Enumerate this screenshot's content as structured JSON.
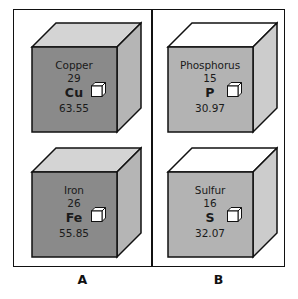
{
  "figure": {
    "panels": [
      {
        "id": "A",
        "caption": "A",
        "cube_front_color": "#8a8a8a",
        "cube_top_color": "#d4d4d4",
        "cube_side_color": "#b5b5b5",
        "elements": [
          {
            "name": "Copper",
            "atomic_number": "29",
            "symbol": "Cu",
            "atomic_mass": "63.55",
            "icon": "unit-cube-icon"
          },
          {
            "name": "Iron",
            "atomic_number": "26",
            "symbol": "Fe",
            "atomic_mass": "55.85",
            "icon": "unit-cube-icon"
          }
        ]
      },
      {
        "id": "B",
        "caption": "B",
        "cube_front_color": "#b3b3b3",
        "cube_top_color": "#ffffff",
        "cube_side_color": "#cccccc",
        "elements": [
          {
            "name": "Phosphorus",
            "atomic_number": "15",
            "symbol": "P",
            "atomic_mass": "30.97",
            "icon": "unit-cube-icon"
          },
          {
            "name": "Sulfur",
            "atomic_number": "16",
            "symbol": "S",
            "atomic_mass": "32.07",
            "icon": "unit-cube-icon"
          }
        ]
      }
    ],
    "colors": {
      "border": "#111111",
      "text": "#1a1a1a",
      "background": "#ffffff",
      "mini_cube_fill": "#ffffff"
    }
  }
}
